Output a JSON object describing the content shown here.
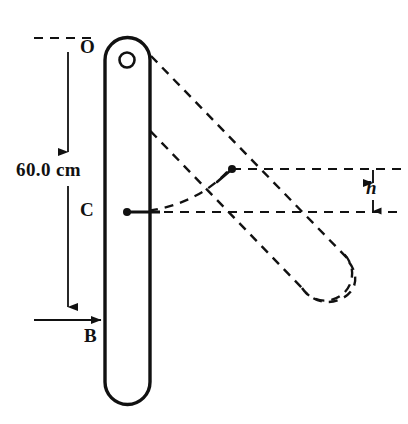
{
  "figure": {
    "type": "physics-mechanics-diagram",
    "width": 408,
    "height": 424,
    "background_color": "#ffffff",
    "line_color": "#111111"
  },
  "labels": {
    "pivot": "O",
    "center_of_mass": "C",
    "bottom_end": "B",
    "length_dimension": "60.0 cm",
    "height_dimension": "h"
  },
  "measurements": {
    "rod_length_value": 60.0,
    "rod_length_unit": "cm",
    "rod_length_text": "60.0 cm",
    "rise_symbol": "h"
  },
  "geometry": {
    "rod_solid": {
      "state": "initial-vertical",
      "stroke": "#111111",
      "stroke_width": 3.4,
      "fill": "none",
      "left_edge_x": 105,
      "right_edge_x": 150,
      "top_cap_center_y": 60,
      "bottom_cap_center_y": 382,
      "cap_radius": 22.5
    },
    "rod_dashed": {
      "state": "rotated-position",
      "stroke": "#111111",
      "stroke_width": 2.4,
      "dash": "9 7",
      "fill": "none",
      "angle_degrees": 45,
      "far_cap_center_x": 330,
      "far_cap_center_y": 283
    },
    "pivot_hole": {
      "cx": 127,
      "cy": 60,
      "r": 7.5
    },
    "center_of_mass_point": {
      "cx": 127,
      "cy": 212,
      "r": 3.8
    },
    "raised_center_point": {
      "cx": 232,
      "cy": 169,
      "r": 3.8
    },
    "dimension_line": {
      "x": 68,
      "y_top": 40,
      "y_bottom": 318,
      "arrow_top": "up",
      "arrow_bottom": "down"
    },
    "height_dimension": {
      "x": 373,
      "y_top": 169,
      "y_bottom": 212,
      "arrows": "both"
    },
    "reference_line_upper": {
      "y": 169,
      "x_start": 232,
      "x_end": 402
    },
    "reference_line_lower": {
      "y": 212,
      "x_start": 127,
      "x_end": 402
    },
    "arc_path": {
      "from": "C",
      "to": "raised-center",
      "style": "dashed"
    }
  }
}
